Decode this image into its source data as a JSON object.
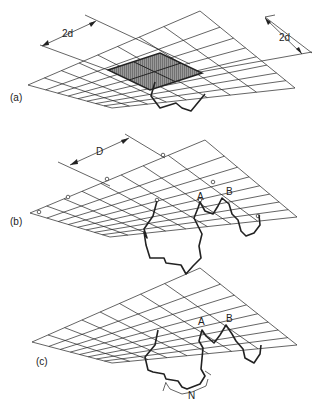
{
  "panels": [
    {
      "id": "a",
      "label": "(a)",
      "dimensions": [
        "2d",
        "2d"
      ]
    },
    {
      "id": "b",
      "label": "(b)",
      "dimensions": [
        "D"
      ],
      "points": [
        "A",
        "B"
      ]
    },
    {
      "id": "c",
      "label": "(c)",
      "points": [
        "A",
        "B",
        "N"
      ]
    }
  ]
}
